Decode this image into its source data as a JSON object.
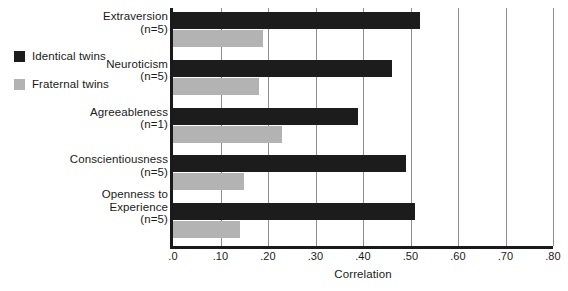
{
  "legend": {
    "items": [
      {
        "label": "Identical twins",
        "color": "#1c1c1c",
        "swatch_name": "identical-twins-swatch"
      },
      {
        "label": "Fraternal twins",
        "color": "#b3b3b3",
        "swatch_name": "fraternal-twins-swatch"
      }
    ]
  },
  "axis": {
    "title": "Correlation",
    "ticks": [
      ".0",
      ".10",
      ".20",
      ".30",
      ".40",
      ".50",
      ".60",
      ".70",
      ".80"
    ],
    "tick_values": [
      0.0,
      0.1,
      0.2,
      0.3,
      0.4,
      0.5,
      0.6,
      0.7,
      0.8
    ]
  },
  "categories": [
    {
      "name": "Extraversion",
      "n": "(n=5)"
    },
    {
      "name": "Neuroticism",
      "n": "(n=5)"
    },
    {
      "name": "Agreeableness",
      "n": "(n=1)"
    },
    {
      "name": "Conscientiousness",
      "n": "(n=5)"
    },
    {
      "name": "Openness to\nExperience",
      "n": "(n=5)"
    }
  ],
  "chart_data": {
    "type": "bar",
    "orientation": "horizontal",
    "title": "",
    "xlabel": "Correlation",
    "ylabel": "",
    "xlim": [
      0.0,
      0.8
    ],
    "grid": true,
    "grid_axis": "x",
    "legend_position": "left",
    "categories": [
      "Extraversion (n=5)",
      "Neuroticism (n=5)",
      "Agreeableness (n=1)",
      "Conscientiousness (n=5)",
      "Openness to Experience (n=5)"
    ],
    "series": [
      {
        "name": "Identical twins",
        "color": "#1c1c1c",
        "values": [
          0.52,
          0.46,
          0.39,
          0.49,
          0.51
        ]
      },
      {
        "name": "Fraternal twins",
        "color": "#b3b3b3",
        "values": [
          0.19,
          0.18,
          0.23,
          0.15,
          0.14
        ]
      }
    ],
    "tick_labels": [
      ".0",
      ".10",
      ".20",
      ".30",
      ".40",
      ".50",
      ".60",
      ".70",
      ".80"
    ]
  }
}
